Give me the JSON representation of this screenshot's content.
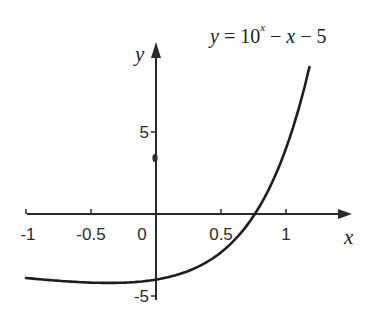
{
  "chart_data": {
    "type": "line",
    "title_parts": {
      "lhs": "y",
      "eq": " = 10",
      "exp": "x",
      "rest_a": " − ",
      "rest_x": "x",
      "rest_b": " − 5"
    },
    "xlabel": "x",
    "ylabel": "y",
    "xlim": [
      -1,
      1.2
    ],
    "ylim": [
      -5,
      10
    ],
    "grid": false,
    "x_ticks": [
      -1,
      -0.5,
      0,
      0.5,
      1
    ],
    "x_tick_labels": [
      "-1",
      "-0.5",
      "0",
      "0.5",
      "1"
    ],
    "y_ticks": [
      5,
      -5
    ],
    "y_tick_labels": [
      "5",
      "-5"
    ],
    "series": [
      {
        "name": "y = 10^x − x − 5",
        "function": "10^x - x - 5",
        "x_range": [
          -1,
          1.18
        ],
        "points": [
          [
            -1.0,
            -3.9
          ],
          [
            -0.75,
            -4.07
          ],
          [
            -0.5,
            -4.18
          ],
          [
            -0.25,
            -4.19
          ],
          [
            0.0,
            -4.0
          ],
          [
            0.25,
            -3.47
          ],
          [
            0.5,
            -2.34
          ],
          [
            0.75,
            -0.13
          ],
          [
            0.8,
            0.51
          ],
          [
            1.0,
            4.0
          ],
          [
            1.1,
            6.49
          ],
          [
            1.18,
            8.96
          ]
        ]
      }
    ],
    "annotation": "small dot on y-axis near y=3.5"
  }
}
